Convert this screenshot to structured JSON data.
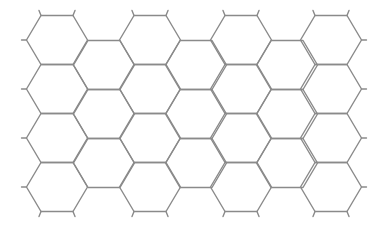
{
  "diagram": {
    "type": "hexagonal-grid",
    "orientation": "flat-top",
    "stroke_color": "#8a8a8a",
    "stroke_width": 1.4,
    "background": "#ffffff",
    "hex": {
      "half_width": 30.5,
      "edge_half": 16,
      "half_height": 24.5
    },
    "stub_length": 5,
    "columns": [
      {
        "x": 57,
        "rows": [
          40,
          89,
          138,
          187
        ],
        "kind": "main"
      },
      {
        "x": 104,
        "rows": [
          65,
          114,
          163
        ],
        "kind": "offset"
      },
      {
        "x": 150,
        "rows": [
          40,
          89,
          138,
          187
        ],
        "kind": "main"
      },
      {
        "x": 196,
        "rows": [
          65,
          114,
          163
        ],
        "kind": "offset"
      },
      {
        "x": 241,
        "rows": [
          40,
          89,
          138,
          187
        ],
        "kind": "main"
      },
      {
        "x": 287,
        "rows": [
          65,
          114,
          163
        ],
        "kind": "offset"
      },
      {
        "x": 331,
        "rows": [
          40,
          89,
          138,
          187
        ],
        "kind": "main"
      }
    ]
  }
}
